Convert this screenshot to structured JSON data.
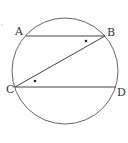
{
  "figure": {
    "circle": {
      "cx": 65,
      "cy": 71,
      "r": 53
    },
    "points": {
      "A": {
        "label": "A",
        "x": 26,
        "y": 36
      },
      "B": {
        "label": "B",
        "x": 105,
        "y": 36
      },
      "C": {
        "label": "C",
        "x": 15,
        "y": 87
      },
      "D": {
        "label": "D",
        "x": 116,
        "y": 87
      }
    },
    "segments": [
      "AB",
      "CD",
      "CB"
    ],
    "angle_marks": [
      {
        "at": "B",
        "between": "AB-BC",
        "x": 86,
        "y": 41
      },
      {
        "at": "C",
        "between": "BC-CD",
        "x": 35,
        "y": 81
      }
    ],
    "stroke_color": "#444444",
    "text_color": "#333333"
  },
  "labels": {
    "A": "A",
    "B": "B",
    "C": "C",
    "D": "D"
  }
}
